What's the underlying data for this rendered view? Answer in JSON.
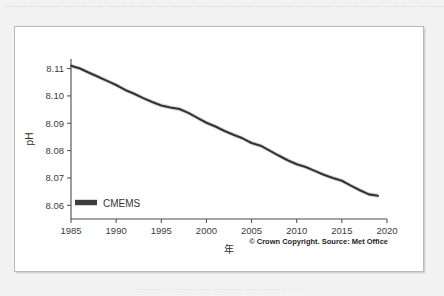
{
  "page": {
    "background_color": "#f2f2f2",
    "ghost_text_top": "— —— — ——— —— — —— ——— — —— —— ——— — ——— —— — ———— — —— ——— —— — ——— —— —— — ———",
    "ghost_text_bottom": "———— ——— —— ———— —— ——— ——"
  },
  "panel": {
    "border_color": "#b9b9b9",
    "background_color": "#ffffff"
  },
  "chart_data": {
    "type": "line",
    "title": "",
    "xlabel": "年",
    "ylabel": "pH",
    "xlim": [
      1985,
      2020
    ],
    "ylim": [
      8.055,
      8.1135
    ],
    "grid": false,
    "legend_position": "bottom-left",
    "line_color": "#333333",
    "band_color": "#cfcfcf",
    "xticks": [
      1985,
      1990,
      1995,
      2000,
      2005,
      2010,
      2015,
      2020
    ],
    "xtick_labels": [
      "1985",
      "1990",
      "1995",
      "2000",
      "2005",
      "2010",
      "2015",
      "2020"
    ],
    "yticks": [
      8.06,
      8.07,
      8.08,
      8.09,
      8.1,
      8.11
    ],
    "ytick_labels": [
      "8.06",
      "8.07",
      "8.08",
      "8.09",
      "8.10",
      "8.11"
    ],
    "series": [
      {
        "name": "CMEMS",
        "x": [
          1985,
          1986,
          1987,
          1988,
          1989,
          1990,
          1991,
          1992,
          1993,
          1994,
          1995,
          1996,
          1997,
          1998,
          1999,
          2000,
          2001,
          2002,
          2003,
          2004,
          2005,
          2006,
          2007,
          2008,
          2009,
          2010,
          2011,
          2012,
          2013,
          2014,
          2015,
          2016,
          2017,
          2018,
          2019
        ],
        "values": [
          8.111,
          8.11,
          8.1085,
          8.107,
          8.1055,
          8.104,
          8.1022,
          8.1008,
          8.0992,
          8.0978,
          8.0965,
          8.0958,
          8.0952,
          8.0938,
          8.092,
          8.0902,
          8.0888,
          8.0872,
          8.0858,
          8.0845,
          8.0828,
          8.0818,
          8.08,
          8.0782,
          8.0765,
          8.075,
          8.074,
          8.0726,
          8.0712,
          8.07,
          8.069,
          8.0672,
          8.0655,
          8.064,
          8.0635
        ],
        "band_upper": [
          8.1118,
          8.1108,
          8.1093,
          8.1078,
          8.1063,
          8.1048,
          8.103,
          8.1016,
          8.1,
          8.0986,
          8.0973,
          8.0966,
          8.096,
          8.0946,
          8.0928,
          8.091,
          8.0896,
          8.088,
          8.0866,
          8.0853,
          8.0836,
          8.0826,
          8.0808,
          8.079,
          8.0773,
          8.0758,
          8.0748,
          8.0734,
          8.072,
          8.0708,
          8.0698,
          8.068,
          8.0663,
          8.0648,
          8.0643
        ],
        "band_lower": [
          8.1102,
          8.1092,
          8.1077,
          8.1062,
          8.1047,
          8.1032,
          8.1014,
          8.1,
          8.0984,
          8.097,
          8.0957,
          8.095,
          8.0944,
          8.093,
          8.0912,
          8.0894,
          8.088,
          8.0864,
          8.085,
          8.0837,
          8.082,
          8.081,
          8.0792,
          8.0774,
          8.0757,
          8.0742,
          8.0732,
          8.0718,
          8.0704,
          8.0692,
          8.0682,
          8.0664,
          8.0647,
          8.0632,
          8.0627
        ]
      }
    ],
    "annotations": [
      {
        "name": "credit",
        "text": "© Crown Copyright. Source: Met Office"
      }
    ]
  },
  "legend": {
    "entries": [
      {
        "label": "CMEMS",
        "color": "#3d3d3d"
      }
    ]
  },
  "credit": {
    "text": "© Crown Copyright. Source: Met Office"
  }
}
